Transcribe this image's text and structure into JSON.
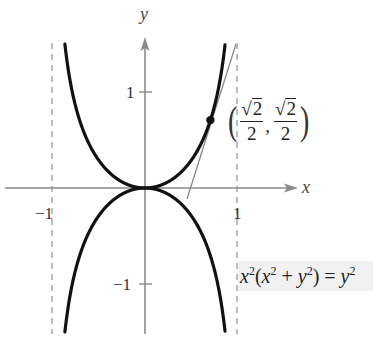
{
  "figure": {
    "equation": {
      "parts": [
        "x",
        "2",
        "(",
        "x",
        "2",
        " + ",
        "y",
        "2",
        ") = ",
        "y",
        "2"
      ],
      "text": "x^2(x^2 + y^2) = y^2"
    },
    "axes": {
      "x_label": "x",
      "y_label": "y",
      "x_ticks": [
        {
          "value": -1,
          "label": "−1"
        },
        {
          "value": 1,
          "label": "1"
        }
      ],
      "y_ticks": [
        {
          "value": 1,
          "label": "1"
        },
        {
          "value": -1,
          "label": "−1"
        }
      ]
    },
    "asymptotes": [
      {
        "x": -1,
        "style": "dashed"
      },
      {
        "x": 1,
        "style": "dashed"
      }
    ],
    "point": {
      "x": 0.7071,
      "y": 0.7071,
      "label_x_num": "2",
      "label_x_den": "2",
      "label_y_num": "2",
      "label_y_den": "2",
      "label_text": "(√2/2, √2/2)"
    },
    "tangent_line": {
      "point": [
        0.7071,
        0.7071
      ],
      "slope": 3
    },
    "colors": {
      "curve": "#111111",
      "axis": "#8a8a8a",
      "asymptote": "#9a9a9a",
      "tangent": "#888888",
      "equation_bg": "#f1f1f1"
    }
  }
}
